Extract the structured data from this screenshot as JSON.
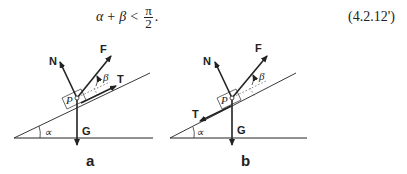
{
  "equation": {
    "lhs_a": "α",
    "plus": "+",
    "lhs_b": "β",
    "lt": "<",
    "numerator": "π",
    "denominator": "2",
    "period": ".",
    "number": "(4.2.12')"
  },
  "figures": [
    {
      "caption": "a",
      "labels": {
        "N": "N",
        "F": "F",
        "T": "T",
        "G": "G",
        "P": "P",
        "beta": "β",
        "alpha": "∝"
      }
    },
    {
      "caption": "b",
      "labels": {
        "N": "N",
        "F": "F",
        "T": "T",
        "G": "G",
        "P": "P",
        "beta": "β",
        "alpha": "∝"
      }
    }
  ]
}
